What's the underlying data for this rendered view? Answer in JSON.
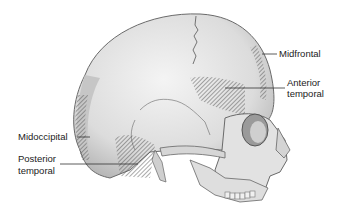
{
  "figure": {
    "labels": [
      {
        "id": "midfrontal",
        "text": "Midfrontal"
      },
      {
        "id": "anterior-temporal",
        "line1": "Anterior",
        "line2": "temporal"
      },
      {
        "id": "midoccipital",
        "text": "Midoccipital"
      },
      {
        "id": "posterior-temporal",
        "line1": "Posterior",
        "line2": "temporal"
      }
    ],
    "colors": {
      "bone": "#e4e4e4",
      "shade": "#b9b9b9",
      "outline": "#6a6a6a",
      "hatch": "#555555",
      "text": "#222222"
    }
  }
}
